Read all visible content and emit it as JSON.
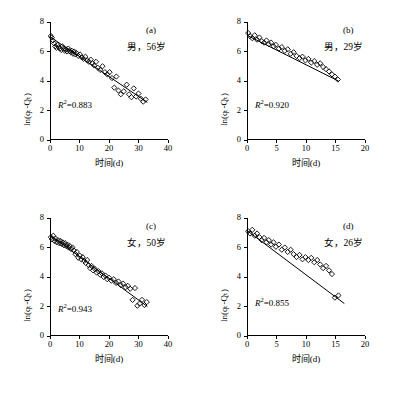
{
  "figure": {
    "panels": [
      {
        "id": "a",
        "label": "(a)",
        "subject": "男，56岁",
        "r2_prefix": "R",
        "r2_sup": "2",
        "r2_value": "=0.883",
        "xlabel": "时间(d)",
        "ylabel": "ln(qₜ-Qₜ)",
        "xticks": [
          "0",
          "10",
          "20",
          "30",
          "40"
        ],
        "yticks": [
          "0",
          "2",
          "4",
          "6",
          "8"
        ],
        "xlim": [
          0,
          40
        ],
        "ylim": [
          0,
          8
        ],
        "fit": {
          "x0": 0.0,
          "y0": 7.0,
          "x1": 33.0,
          "y1": 2.55
        },
        "points": [
          [
            0.3,
            7.05
          ],
          [
            0.6,
            6.95
          ],
          [
            1.0,
            6.75
          ],
          [
            1.4,
            6.55
          ],
          [
            1.8,
            6.35
          ],
          [
            2.2,
            6.25
          ],
          [
            2.6,
            6.45
          ],
          [
            3.0,
            6.3
          ],
          [
            3.4,
            6.2
          ],
          [
            3.8,
            6.1
          ],
          [
            4.2,
            6.35
          ],
          [
            4.6,
            6.2
          ],
          [
            5.0,
            6.05
          ],
          [
            5.4,
            6.15
          ],
          [
            5.8,
            6.0
          ],
          [
            6.2,
            6.2
          ],
          [
            6.6,
            6.05
          ],
          [
            7.0,
            5.95
          ],
          [
            7.4,
            6.05
          ],
          [
            7.8,
            5.85
          ],
          [
            8.2,
            6.0
          ],
          [
            8.6,
            5.8
          ],
          [
            9.0,
            5.9
          ],
          [
            9.6,
            5.7
          ],
          [
            10.2,
            5.8
          ],
          [
            10.8,
            5.6
          ],
          [
            11.4,
            5.5
          ],
          [
            12.0,
            5.65
          ],
          [
            12.6,
            5.4
          ],
          [
            13.2,
            5.3
          ],
          [
            13.8,
            5.45
          ],
          [
            14.4,
            5.2
          ],
          [
            15.0,
            5.05
          ],
          [
            15.6,
            5.3
          ],
          [
            16.2,
            4.9
          ],
          [
            17.0,
            4.75
          ],
          [
            17.8,
            5.0
          ],
          [
            18.6,
            4.6
          ],
          [
            19.4,
            4.45
          ],
          [
            20.2,
            4.6
          ],
          [
            21.0,
            4.2
          ],
          [
            21.8,
            3.55
          ],
          [
            22.5,
            4.3
          ],
          [
            23.2,
            3.35
          ],
          [
            24.0,
            3.1
          ],
          [
            25.0,
            3.3
          ],
          [
            26.0,
            3.75
          ],
          [
            26.8,
            3.1
          ],
          [
            27.6,
            2.9
          ],
          [
            28.4,
            3.5
          ],
          [
            29.2,
            2.95
          ],
          [
            30.0,
            3.15
          ],
          [
            30.8,
            2.8
          ],
          [
            31.6,
            2.6
          ],
          [
            32.4,
            2.75
          ]
        ]
      },
      {
        "id": "b",
        "label": "(b)",
        "subject": "男，29岁",
        "r2_prefix": "R",
        "r2_sup": "2",
        "r2_value": "=0.920",
        "xlabel": "时间(d)",
        "ylabel": "ln(qₜ-Qₜ)",
        "xticks": [
          "0",
          "5",
          "10",
          "15",
          "20"
        ],
        "yticks": [
          "0",
          "2",
          "4",
          "6",
          "8"
        ],
        "xlim": [
          0,
          20
        ],
        "ylim": [
          0,
          8
        ],
        "fit": {
          "x0": 0.0,
          "y0": 7.1,
          "x1": 15.5,
          "y1": 4.0
        },
        "points": [
          [
            0.2,
            7.25
          ],
          [
            0.5,
            7.05
          ],
          [
            0.9,
            6.9
          ],
          [
            1.3,
            7.1
          ],
          [
            1.7,
            6.8
          ],
          [
            2.1,
            6.95
          ],
          [
            2.5,
            6.7
          ],
          [
            2.9,
            6.6
          ],
          [
            3.3,
            6.75
          ],
          [
            3.7,
            6.5
          ],
          [
            4.1,
            6.6
          ],
          [
            4.5,
            6.35
          ],
          [
            4.9,
            6.45
          ],
          [
            5.4,
            6.2
          ],
          [
            5.9,
            6.3
          ],
          [
            6.4,
            6.05
          ],
          [
            6.9,
            6.15
          ],
          [
            7.4,
            5.85
          ],
          [
            7.9,
            5.95
          ],
          [
            8.4,
            5.7
          ],
          [
            8.9,
            5.55
          ],
          [
            9.4,
            5.65
          ],
          [
            9.9,
            5.4
          ],
          [
            10.4,
            5.5
          ],
          [
            10.9,
            5.25
          ],
          [
            11.4,
            5.35
          ],
          [
            11.9,
            5.1
          ],
          [
            12.4,
            5.2
          ],
          [
            12.9,
            4.95
          ],
          [
            13.4,
            4.8
          ],
          [
            13.9,
            4.65
          ],
          [
            14.4,
            4.45
          ],
          [
            14.9,
            4.3
          ],
          [
            15.4,
            4.1
          ]
        ]
      },
      {
        "id": "c",
        "label": "(c)",
        "subject": "女，50岁",
        "r2_prefix": "R",
        "r2_sup": "2",
        "r2_value": "=0.943",
        "xlabel": "时间(d)",
        "ylabel": "ln(qₜ-Qₜ)",
        "xticks": [
          "0",
          "10",
          "20",
          "30",
          "40"
        ],
        "yticks": [
          "0",
          "2",
          "4",
          "6",
          "8"
        ],
        "xlim": [
          0,
          40
        ],
        "ylim": [
          0,
          8
        ],
        "fit": {
          "x0": 0.0,
          "y0": 6.85,
          "x1": 33.0,
          "y1": 2.0
        },
        "points": [
          [
            0.3,
            6.7
          ],
          [
            0.7,
            6.55
          ],
          [
            1.1,
            6.8
          ],
          [
            1.5,
            6.45
          ],
          [
            1.9,
            6.6
          ],
          [
            2.3,
            6.35
          ],
          [
            2.7,
            6.5
          ],
          [
            3.1,
            6.3
          ],
          [
            3.5,
            6.45
          ],
          [
            3.9,
            6.25
          ],
          [
            4.3,
            6.35
          ],
          [
            4.7,
            6.15
          ],
          [
            5.1,
            6.3
          ],
          [
            5.5,
            6.1
          ],
          [
            5.9,
            6.2
          ],
          [
            6.3,
            6.0
          ],
          [
            6.7,
            6.1
          ],
          [
            7.1,
            5.9
          ],
          [
            7.6,
            6.0
          ],
          [
            8.1,
            5.8
          ],
          [
            8.6,
            5.55
          ],
          [
            9.1,
            5.7
          ],
          [
            9.6,
            5.3
          ],
          [
            10.1,
            5.45
          ],
          [
            10.6,
            5.2
          ],
          [
            11.1,
            5.35
          ],
          [
            11.6,
            5.1
          ],
          [
            12.1,
            4.95
          ],
          [
            12.6,
            5.15
          ],
          [
            13.1,
            4.8
          ],
          [
            13.6,
            4.6
          ],
          [
            14.1,
            4.75
          ],
          [
            14.6,
            4.45
          ],
          [
            15.2,
            4.55
          ],
          [
            15.8,
            4.3
          ],
          [
            16.4,
            4.4
          ],
          [
            17.0,
            4.15
          ],
          [
            17.6,
            4.25
          ],
          [
            18.2,
            4.0
          ],
          [
            18.8,
            4.1
          ],
          [
            19.4,
            3.85
          ],
          [
            20.0,
            3.95
          ],
          [
            20.8,
            3.75
          ],
          [
            21.6,
            3.85
          ],
          [
            22.4,
            3.6
          ],
          [
            23.2,
            3.7
          ],
          [
            24.0,
            3.45
          ],
          [
            24.8,
            3.55
          ],
          [
            25.6,
            3.3
          ],
          [
            26.4,
            3.4
          ],
          [
            27.2,
            3.2
          ],
          [
            28.0,
            2.45
          ],
          [
            28.8,
            3.25
          ],
          [
            29.6,
            2.05
          ],
          [
            30.4,
            2.2
          ],
          [
            31.2,
            2.45
          ],
          [
            32.0,
            2.1
          ],
          [
            32.8,
            2.3
          ]
        ]
      },
      {
        "id": "d",
        "label": "(d)",
        "subject": "女，26岁",
        "r2_prefix": "R",
        "r2_sup": "2",
        "r2_value": "=0.855",
        "xlabel": "时间(d)",
        "ylabel": "ln(qₜ-Qₜ)",
        "xticks": [
          "0",
          "5",
          "10",
          "15",
          "20"
        ],
        "yticks": [
          "0",
          "2",
          "4",
          "6",
          "8"
        ],
        "xlim": [
          0,
          20
        ],
        "ylim": [
          0,
          8
        ],
        "fit": {
          "x0": 0.0,
          "y0": 7.15,
          "x1": 16.5,
          "y1": 2.2
        },
        "points": [
          [
            0.2,
            7.1
          ],
          [
            0.5,
            6.95
          ],
          [
            0.9,
            7.2
          ],
          [
            1.3,
            6.8
          ],
          [
            1.7,
            6.95
          ],
          [
            2.1,
            6.7
          ],
          [
            2.5,
            6.5
          ],
          [
            2.9,
            6.65
          ],
          [
            3.3,
            6.35
          ],
          [
            3.7,
            6.5
          ],
          [
            4.1,
            6.2
          ],
          [
            4.5,
            6.35
          ],
          [
            4.9,
            6.05
          ],
          [
            5.4,
            6.2
          ],
          [
            5.9,
            5.85
          ],
          [
            6.4,
            6.0
          ],
          [
            6.9,
            5.7
          ],
          [
            7.4,
            5.85
          ],
          [
            7.9,
            5.55
          ],
          [
            8.4,
            5.35
          ],
          [
            8.9,
            5.5
          ],
          [
            9.4,
            5.2
          ],
          [
            9.9,
            5.35
          ],
          [
            10.4,
            5.15
          ],
          [
            10.9,
            5.3
          ],
          [
            11.4,
            5.0
          ],
          [
            11.9,
            5.15
          ],
          [
            12.4,
            4.85
          ],
          [
            12.9,
            4.6
          ],
          [
            13.4,
            4.75
          ],
          [
            13.9,
            4.45
          ],
          [
            14.4,
            4.2
          ],
          [
            14.9,
            2.6
          ],
          [
            15.5,
            2.75
          ]
        ]
      }
    ]
  }
}
